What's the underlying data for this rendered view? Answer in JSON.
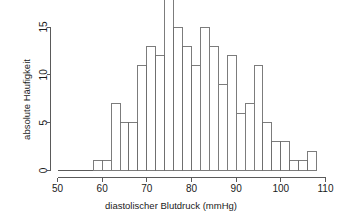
{
  "chart_data": {
    "type": "bar",
    "title": "",
    "subtitle": "",
    "xlabel": "diastolischer Blutdruck (mmHg)",
    "ylabel": "absolute Häufigkeit",
    "xlim": [
      50,
      110
    ],
    "ylim": [
      0,
      18
    ],
    "grid": false,
    "legend": null,
    "legend_position": "none",
    "bin_width": 2,
    "x_ticks": [
      50,
      60,
      70,
      80,
      90,
      100,
      110
    ],
    "x_tick_labels": [
      "50",
      "60",
      "70",
      "80",
      "90",
      "100",
      "110"
    ],
    "y_ticks": [
      0,
      5,
      10,
      15
    ],
    "y_tick_labels": [
      "0",
      "5",
      "10",
      "15"
    ],
    "bin_edges": [
      58,
      60,
      62,
      64,
      66,
      68,
      70,
      72,
      74,
      76,
      78,
      80,
      82,
      84,
      86,
      88,
      90,
      92,
      94,
      96,
      98,
      100,
      102,
      104,
      106,
      108
    ],
    "categories": [
      "58-60",
      "60-62",
      "62-64",
      "64-66",
      "66-68",
      "68-70",
      "70-72",
      "72-74",
      "74-76",
      "76-78",
      "78-80",
      "80-82",
      "82-84",
      "84-86",
      "86-88",
      "88-90",
      "90-92",
      "92-94",
      "94-96",
      "96-98",
      "98-100",
      "100-102",
      "102-104",
      "104-106",
      "106-108"
    ],
    "values": [
      1,
      1,
      7,
      5,
      5,
      11,
      13,
      12,
      18,
      15,
      13,
      11,
      15,
      13,
      9,
      12,
      6,
      7,
      11,
      5,
      3,
      3,
      1,
      1,
      2
    ],
    "colors": {
      "bar_fill": "#ffffff",
      "bar_stroke": "#6e6e6e",
      "axis": "#5a5a5a",
      "text": "#1a1a1a",
      "background": "#ffffff"
    }
  },
  "axes": {
    "x_title": "diastolischer Blutdruck (mmHg)",
    "y_title": "absolute Häufigkeit"
  }
}
